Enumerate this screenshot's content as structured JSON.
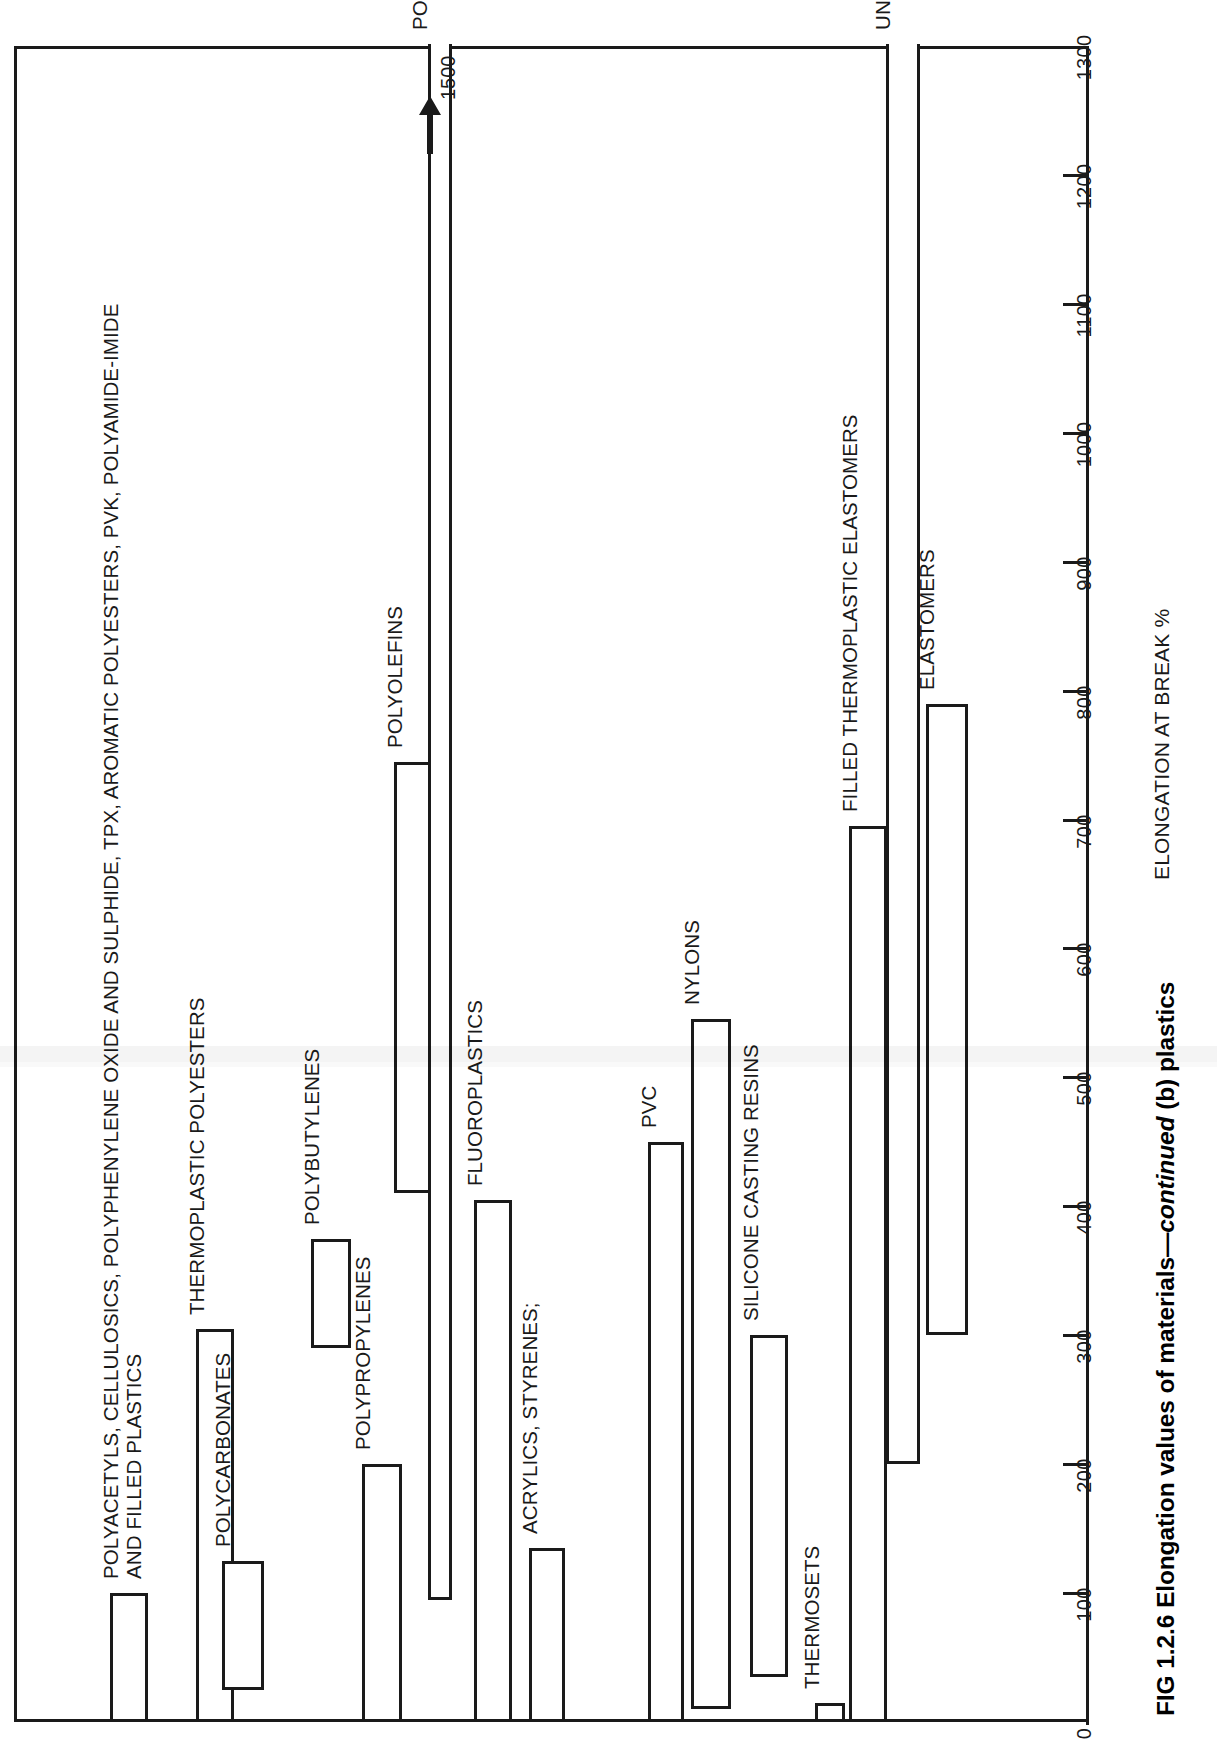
{
  "figure": {
    "caption_prefix": "FIG 1.2.6 Elongation values of materials—",
    "caption_italic": "continued",
    "caption_suffix": " (b) plastics",
    "axis_title": "ELONGATION AT BREAK %",
    "overflow_arrow_value": "1500",
    "overflow_arrow_name": "up-arrow-icon"
  },
  "chart_data": {
    "type": "bar",
    "orientation": "horizontal-rotated",
    "title": "FIG 1.2.6 Elongation values of materials—continued (b) plastics",
    "xlabel": "ELONGATION AT BREAK %",
    "ylabel": "",
    "xlim": [
      0,
      1300
    ],
    "grid": false,
    "legend": "none",
    "tick_labels": [
      "0",
      "100",
      "200",
      "300",
      "400",
      "500",
      "600",
      "700",
      "800",
      "900",
      "1000",
      "1100",
      "1200",
      "1300"
    ],
    "tick_values": [
      0,
      100,
      200,
      300,
      400,
      500,
      600,
      700,
      800,
      900,
      1000,
      1100,
      1200,
      1300
    ],
    "note": "Each category is a floating range bar (low-high elongation at break, %). POLYETHYLENES extends off-scale to 1500, marked with an arrow.",
    "categories": [
      "POLYACETYLS, CELLULOSICS, POLYPHENYLENE OXIDE AND SULPHIDE, TPX, AROMATIC POLYESTERS, PVK, POLYAMIDE-IMIDE AND FILLED PLASTICS",
      "THERMOPLASTIC POLYESTERS",
      "POLYCARBONATES",
      "POLYBUTYLENES",
      "POLYPROPYLENES",
      "POLYOLEFINS",
      "POLYETHYLENES",
      "FLUOROPLASTICS",
      "ACRYLICS, STYRENES;",
      "PVC",
      "NYLONS",
      "SILICONE CASTING RESINS",
      "THERMOSETS",
      "FILLED THERMOPLASTIC ELASTOMERS",
      "UNFILLED THERMOPLASTIC ELASTOMERS",
      "ELASTOMERS"
    ],
    "ranges": [
      {
        "label": "POLYACETYLS, CELLULOSICS, POLYPHENYLENE OXIDE AND SULPHIDE, TPX, AROMATIC POLYESTERS, PVK, POLYAMIDE-IMIDE\nAND FILLED PLASTICS",
        "low": 0,
        "high": 100,
        "overflow": false
      },
      {
        "label": "THERMOPLASTIC POLYESTERS",
        "low": 0,
        "high": 305,
        "overflow": false
      },
      {
        "label": "POLYCARBONATES",
        "low": 25,
        "high": 125,
        "overflow": false
      },
      {
        "label": "POLYBUTYLENES",
        "low": 290,
        "high": 375,
        "overflow": false
      },
      {
        "label": "POLYPROPYLENES",
        "low": 0,
        "high": 200,
        "overflow": false
      },
      {
        "label": "POLYOLEFINS",
        "low": 410,
        "high": 745,
        "overflow": false
      },
      {
        "label": "POLYETHYLENES",
        "low": 95,
        "high": 1500,
        "overflow": true
      },
      {
        "label": "FLUOROPLASTICS",
        "low": 0,
        "high": 405,
        "overflow": false
      },
      {
        "label": "ACRYLICS, STYRENES;",
        "low": 0,
        "high": 135,
        "overflow": false
      },
      {
        "label": "PVC",
        "low": 0,
        "high": 450,
        "overflow": false
      },
      {
        "label": "NYLONS",
        "low": 10,
        "high": 545,
        "overflow": false
      },
      {
        "label": "SILICONE CASTING RESINS",
        "low": 35,
        "high": 300,
        "overflow": false
      },
      {
        "label": "THERMOSETS",
        "low": 0,
        "high": 15,
        "overflow": false
      },
      {
        "label": "FILLED THERMOPLASTIC ELASTOMERS",
        "low": 0,
        "high": 695,
        "overflow": false
      },
      {
        "label": "UNFILLED THERMOPLASTIC ELASTOMERS",
        "low": 200,
        "high": 1300,
        "overflow": true
      },
      {
        "label": "ELASTOMERS",
        "low": 300,
        "high": 790,
        "overflow": false
      }
    ]
  }
}
